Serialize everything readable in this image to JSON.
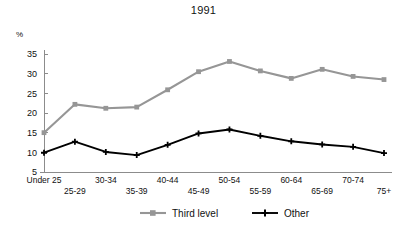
{
  "chart_data": {
    "type": "line",
    "title": "1991",
    "xlabel": "",
    "ylabel": "%",
    "ylim": [
      5,
      35
    ],
    "yticks": [
      5,
      10,
      15,
      20,
      25,
      30,
      35
    ],
    "grid": false,
    "legend_position": "bottom",
    "categories": [
      "Under 25",
      "25-29",
      "30-34",
      "35-39",
      "40-44",
      "45-49",
      "50-54",
      "55-59",
      "60-64",
      "65-69",
      "70-74",
      "75+"
    ],
    "series": [
      {
        "name": "Third level",
        "color": "#969696",
        "marker": "square",
        "values": [
          15.0,
          22.2,
          21.2,
          21.5,
          25.9,
          30.5,
          33.1,
          30.7,
          28.8,
          31.1,
          29.3,
          28.5
        ]
      },
      {
        "name": "Other",
        "color": "#000000",
        "marker": "plus",
        "values": [
          9.9,
          12.7,
          10.1,
          9.3,
          11.9,
          14.8,
          15.8,
          14.2,
          12.8,
          12.0,
          11.4,
          9.8
        ]
      }
    ]
  },
  "legend": {
    "items": [
      {
        "label": "Third level"
      },
      {
        "label": "Other"
      }
    ]
  }
}
